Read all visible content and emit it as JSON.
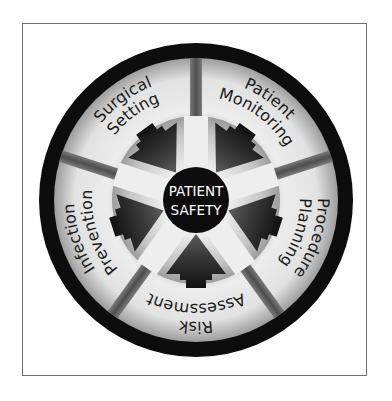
{
  "diagram": {
    "type": "radial-wheel",
    "center": {
      "line1": "PATIENT",
      "line2": "SAFETY"
    },
    "segments": [
      {
        "id": "patient-monitoring",
        "line1": "Patient",
        "line2": "Monitoring",
        "angle_deg": 36
      },
      {
        "id": "procedure-planning",
        "line1": "Procedure",
        "line2": "Planning",
        "angle_deg": 108
      },
      {
        "id": "risk-assessment",
        "line1": "Risk",
        "line2": "Assessment",
        "angle_deg": 180
      },
      {
        "id": "infection-prevention",
        "line1": "Infection",
        "line2": "Prevention",
        "angle_deg": 252
      },
      {
        "id": "surgical-setting",
        "line1": "Surgical",
        "line2": "Setting",
        "angle_deg": 324
      }
    ],
    "colors": {
      "outer_ring": "#0d0d0d",
      "center": "#0d0d0d",
      "arrow": "#2a2a2a",
      "divider": "#5a5a5a",
      "segment_light": "#e8e8e8",
      "text": "#1a1a1a",
      "frame_border": "#6e6e6e"
    }
  }
}
